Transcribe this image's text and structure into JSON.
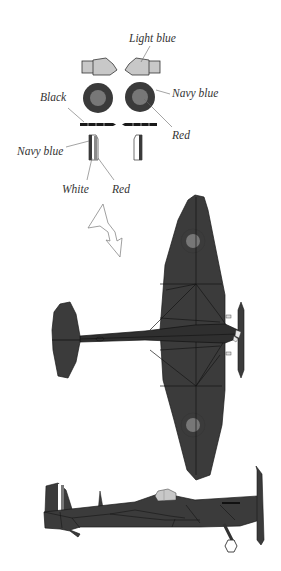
{
  "labels": {
    "light_blue": "Light blue",
    "navy_blue_roundel": "Navy blue",
    "black": "Black",
    "red_roundel": "Red",
    "navy_blue_flash": "Navy blue",
    "white": "White",
    "red_flash": "Red"
  },
  "colors": {
    "background": "#ffffff",
    "plane_body": "#3b3b3b",
    "plane_line": "#1a1a1a",
    "roundel_outer": "#3a3a3a",
    "roundel_inner": "#777777",
    "light_blue_part": "#c8c8c8",
    "label_text": "#333333"
  }
}
